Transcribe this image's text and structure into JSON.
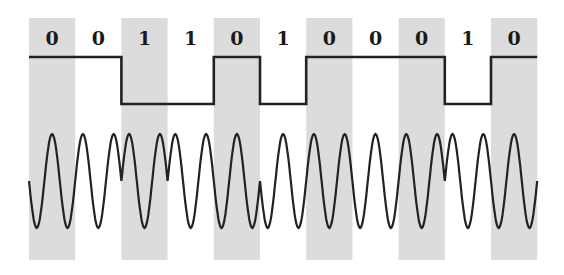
{
  "diagram": {
    "bits": [
      "0",
      "0",
      "1",
      "1",
      "0",
      "1",
      "0",
      "0",
      "0",
      "1",
      "0"
    ],
    "bit_labels": [
      "0",
      "0",
      "1",
      "1",
      "0",
      "1",
      "0",
      "0",
      "0",
      "1",
      "0"
    ],
    "shading": {
      "shaded_bit_indices": [
        0,
        2,
        4,
        6,
        8,
        10
      ],
      "color": "#dcdcdc"
    },
    "line_color": "#222222",
    "digital_signal": {
      "levels": [
        "high",
        "high",
        "low",
        "low",
        "high",
        "low",
        "high",
        "high",
        "high",
        "low",
        "high"
      ]
    },
    "carrier": {
      "cycles_per_bit": 2,
      "phase_shift_on_bit": "1",
      "phase_shift_degrees": 180
    }
  }
}
